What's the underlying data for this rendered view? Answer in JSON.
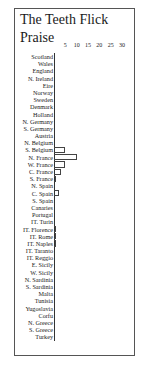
{
  "title_line1": "The Teeth Flick",
  "title_line2": "Praise",
  "chart_data": {
    "type": "bar",
    "orientation": "horizontal",
    "title": "The Teeth Flick Praise",
    "xlabel": "",
    "ylabel": "",
    "xlim": [
      0,
      30
    ],
    "x_ticks": [
      "5",
      "10",
      "15",
      "20",
      "25",
      "30"
    ],
    "grid": false,
    "categories": [
      "Scotland",
      "Wales",
      "England",
      "N. Ireland",
      "Eire",
      "Norway",
      "Sweden",
      "Denmark",
      "Holland",
      "N. Germany",
      "S. Germany",
      "Austria",
      "N. Belgium",
      "S. Belgium",
      "N. France",
      "W. France",
      "C. France",
      "S. France",
      "N. Spain",
      "C. Spain",
      "S. Spain",
      "Canaries",
      "Portugal",
      "IT. Turin",
      "IT. Florence",
      "IT. Rome",
      "IT. Naples",
      "IT. Taranto",
      "IT. Reggio",
      "E. Sicily",
      "W. Sicily",
      "N. Sardinia",
      "S. Sardinia",
      "Malta",
      "Tunisia",
      "Yugoslavia",
      "Corfu",
      "N. Greece",
      "S. Greece",
      "Turkey"
    ],
    "values": [
      0,
      0,
      0,
      0,
      0,
      0,
      0,
      0,
      0,
      0,
      0,
      0,
      0,
      5,
      10,
      5,
      3,
      1,
      0,
      2,
      0,
      0,
      0,
      0,
      1,
      1,
      1,
      0,
      0,
      0,
      0,
      0,
      0,
      0,
      0,
      0,
      0,
      0,
      0,
      0
    ]
  }
}
